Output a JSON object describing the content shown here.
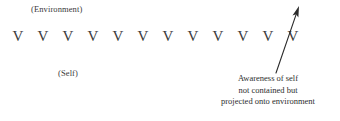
{
  "figure": {
    "background_color": "#ffffff",
    "ink_color": "#2e2e2e",
    "width": 340,
    "height": 121
  },
  "labels": {
    "environment": "(Environment)",
    "self": "(Self)"
  },
  "glyph_row": {
    "glyph": "V",
    "count": 12,
    "start_x": 13,
    "spacing": 25,
    "baseline_y": 45
  },
  "arrow": {
    "icon": "up-right-arrow-icon",
    "tail_x": 276,
    "tail_y": 73,
    "head_x": 299,
    "head_y": 6,
    "color": "#2b2b2b"
  },
  "caption": {
    "lines": [
      "Awareness of self",
      "not contained but",
      "projected onto environment"
    ]
  }
}
